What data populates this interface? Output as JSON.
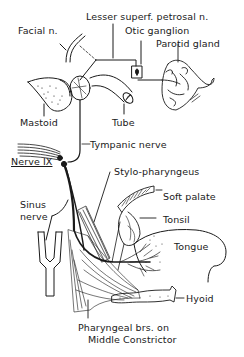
{
  "diagram": {
    "colors": {
      "ink": "#1a1a1a",
      "background": "#ffffff"
    },
    "labels": {
      "facial_n": "Facial n.",
      "lesser_superf_petrosal_n": "Lesser superf. petrosal n.",
      "otic_ganglion": "Otic ganglion",
      "parotid_gland": "Parotid gland",
      "mastoid": "Mastoid",
      "tube": "Tube",
      "tympanic_nerve": "Tympanic nerve",
      "nerve_ix": "Nerve IX",
      "stylo_pharyngeus": "Stylo-pharyngeus",
      "soft_palate": "Soft palate",
      "sinus_nerve_line1": "Sinus",
      "sinus_nerve_line2": "nerve",
      "tonsil": "Tonsil",
      "tongue": "Tongue",
      "hyoid": "Hyoid",
      "pharyngeal_line1": "Pharyngeal brs. on",
      "pharyngeal_line2": "Middle Constrictor"
    },
    "artist_signature": "JC"
  }
}
